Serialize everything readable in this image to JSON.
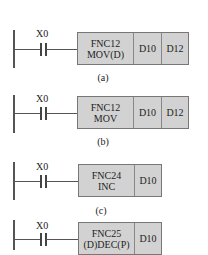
{
  "rungs": [
    {
      "contact": "X0",
      "instruction": [
        "FNC12",
        "MOV(D)"
      ],
      "operands": [
        "D10",
        "D12"
      ],
      "caption": "(a)"
    },
    {
      "contact": "X0",
      "instruction": [
        "FNC12",
        "MOV"
      ],
      "operands": [
        "D10",
        "D12"
      ],
      "caption": "(b)"
    },
    {
      "contact": "X0",
      "instruction": [
        "FNC24",
        "INC"
      ],
      "operands": [
        "D10"
      ],
      "caption": "(c)"
    },
    {
      "contact": "X0",
      "instruction": [
        "FNC25",
        "(D)DEC(P)"
      ],
      "operands": [
        "D10"
      ],
      "caption": ""
    }
  ],
  "colors": {
    "box_fill": "#d2d2d2",
    "line": "#555555"
  }
}
